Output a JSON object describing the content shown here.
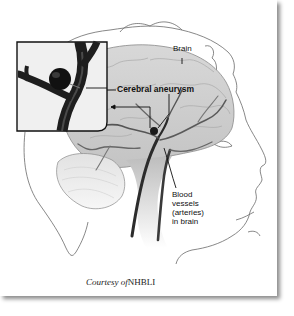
{
  "figure": {
    "labels": {
      "brain": "Brain",
      "aneurysm": "Cerebral aneurysm",
      "vessels_line1": "Blood",
      "vessels_line2": "vessels",
      "vessels_line3": "(arteries)",
      "vessels_line4": "in brain"
    },
    "caption": {
      "prefix": "Courtesy",
      "of": "of",
      "source": "NHBLI"
    },
    "inset": {
      "description": "Magnified view of artery with aneurysm bulge"
    },
    "colors": {
      "background": "#ffffff",
      "brain_fill": "#cfcfcf",
      "vessel": "#2a2a2a",
      "outline": "#555555",
      "inset_border": "#111111"
    }
  }
}
